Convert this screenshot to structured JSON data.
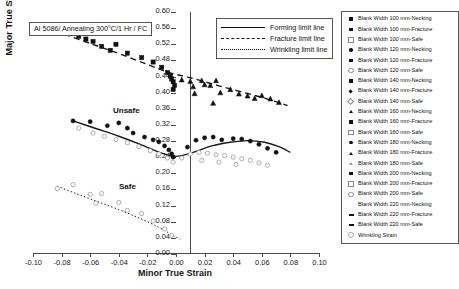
{
  "annotation": {
    "text": "Al 5086/ Annealing 300°C/1 Hr / FC"
  },
  "region_labels": {
    "unsafe": "Unsafe",
    "safe": "Safe"
  },
  "line_legend": {
    "items": [
      {
        "label": "Forming limit line",
        "style": "solid"
      },
      {
        "label": "Fracture limit line",
        "style": "dashed"
      },
      {
        "label": "Wrinkling limit line",
        "style": "dotted"
      }
    ]
  },
  "marker_legend": {
    "items": [
      {
        "label": "Blank Width 100 mm-Necking",
        "glyph": "sq-f"
      },
      {
        "label": "Blank Width 100 mm-Fracture",
        "glyph": "sq-f"
      },
      {
        "label": "Blank Width 100 mm-Safe",
        "glyph": "sq-o"
      },
      {
        "label": "Blank Width 120 mm-Necking",
        "glyph": "ci-f"
      },
      {
        "label": "Blank Width 120 mm-Fracture",
        "glyph": "sq-f"
      },
      {
        "label": "Blank Width 120 mm-Safe",
        "glyph": "ci-o"
      },
      {
        "label": "Blank Width 140 mm-Necking",
        "glyph": "sq-f"
      },
      {
        "label": "Blank Width 140 mm-Fracture",
        "glyph": "di-f"
      },
      {
        "label": "Blank Width 140 mm-Safe",
        "glyph": "di-o"
      },
      {
        "label": "Blank Width 160 mm-Necking",
        "glyph": "tr-f"
      },
      {
        "label": "Blank Width 160 mm-Fracture",
        "glyph": "sq-f"
      },
      {
        "label": "Blank Width 160 mm-Safe",
        "glyph": "sq-o"
      },
      {
        "label": "Blank Width 180 mm-Necking",
        "glyph": "ci-f"
      },
      {
        "label": "Blank Width 180 mm-Fracture",
        "glyph": "tr-f"
      },
      {
        "label": "Blank Width 180 mm-Safe",
        "glyph": "tr-o"
      },
      {
        "label": "Blank Width 200 mm-Necking",
        "glyph": "sq-f"
      },
      {
        "label": "Blank Width 200 mm-Fracture",
        "glyph": "sq-o"
      },
      {
        "label": "Blank Width 200 mm-Safe",
        "glyph": "ci-o"
      },
      {
        "label": "Blank Width 220 mm-Necking",
        "glyph": "blank"
      },
      {
        "label": "Blank Width 220 mm-Fracture",
        "glyph": "ba-f"
      },
      {
        "label": "Blank Width 220 mm-Safe",
        "glyph": "ba-f"
      },
      {
        "label": "Wrinkling Strain",
        "glyph": "st-o"
      }
    ]
  },
  "chart_data": {
    "type": "scatter",
    "title": "",
    "xlabel": "Minor True Strain",
    "ylabel": "Major True Strain",
    "xlim": [
      -0.1,
      0.1
    ],
    "ylim": [
      0.0,
      0.6
    ],
    "xticks": [
      "-0.10",
      "-0.08",
      "-0.06",
      "-0.04",
      "-0.02",
      "0.00",
      "0.02",
      "0.04",
      "0.06",
      "0.08",
      "0.10"
    ],
    "xtick_values": [
      -0.1,
      -0.08,
      -0.06,
      -0.04,
      -0.02,
      0.0,
      0.02,
      0.04,
      0.06,
      0.08,
      0.1
    ],
    "yticks": [
      "0.00",
      "0.04",
      "0.08",
      "0.12",
      "0.16",
      "0.20",
      "0.24",
      "0.28",
      "0.32",
      "0.36",
      "0.40",
      "0.44",
      "0.48",
      "0.52",
      "0.56",
      "0.60"
    ],
    "ytick_values": [
      0.0,
      0.04,
      0.08,
      0.12,
      0.16,
      0.2,
      0.24,
      0.28,
      0.32,
      0.36,
      0.4,
      0.44,
      0.48,
      0.52,
      0.56,
      0.6
    ],
    "grid": false,
    "legend_position": "right",
    "curves": [
      {
        "name": "Fracture limit line",
        "style": "dashed",
        "points": [
          [
            -0.078,
            0.545
          ],
          [
            -0.06,
            0.522
          ],
          [
            -0.04,
            0.497
          ],
          [
            -0.02,
            0.47
          ],
          [
            -0.005,
            0.45
          ],
          [
            0.01,
            0.437
          ],
          [
            0.03,
            0.417
          ],
          [
            0.05,
            0.398
          ],
          [
            0.066,
            0.382
          ],
          [
            0.078,
            0.368
          ]
        ]
      },
      {
        "name": "Forming limit line",
        "style": "solid",
        "points": [
          [
            -0.072,
            0.33
          ],
          [
            -0.055,
            0.31
          ],
          [
            -0.04,
            0.292
          ],
          [
            -0.025,
            0.272
          ],
          [
            -0.01,
            0.25
          ],
          [
            0.0,
            0.242
          ],
          [
            0.012,
            0.252
          ],
          [
            0.025,
            0.268
          ],
          [
            0.038,
            0.277
          ],
          [
            0.05,
            0.281
          ],
          [
            0.062,
            0.277
          ],
          [
            0.072,
            0.266
          ],
          [
            0.08,
            0.252
          ]
        ]
      },
      {
        "name": "Wrinkling limit line",
        "style": "dotted",
        "points": [
          [
            -0.083,
            0.168
          ],
          [
            -0.07,
            0.15
          ],
          [
            -0.055,
            0.13
          ],
          [
            -0.04,
            0.11
          ],
          [
            -0.025,
            0.088
          ],
          [
            -0.012,
            0.066
          ],
          [
            -0.003,
            0.048
          ],
          [
            0.003,
            0.036
          ]
        ]
      }
    ],
    "series": [
      {
        "name": "Fracture points (upper band)",
        "glyph": "sq-f",
        "points": [
          [
            -0.063,
            0.533
          ],
          [
            -0.058,
            0.527
          ],
          [
            -0.052,
            0.515
          ],
          [
            -0.042,
            0.52
          ],
          [
            -0.034,
            0.498
          ],
          [
            -0.024,
            0.487
          ],
          [
            -0.016,
            0.476
          ],
          [
            -0.01,
            0.463
          ],
          [
            -0.006,
            0.45
          ],
          [
            -0.004,
            0.441
          ],
          [
            -0.003,
            0.434
          ],
          [
            -0.002,
            0.427
          ],
          [
            -0.001,
            0.418
          ],
          [
            -0.002,
            0.408
          ],
          [
            -0.068,
            0.54
          ],
          [
            -0.046,
            0.505
          ]
        ]
      },
      {
        "name": "Fracture points (right band)",
        "glyph": "tr-f",
        "points": [
          [
            0.004,
            0.432
          ],
          [
            0.01,
            0.428
          ],
          [
            0.012,
            0.415
          ],
          [
            0.018,
            0.43
          ],
          [
            0.02,
            0.42
          ],
          [
            0.024,
            0.418
          ],
          [
            0.028,
            0.43
          ],
          [
            0.013,
            0.398
          ],
          [
            0.031,
            0.4
          ],
          [
            0.038,
            0.408
          ],
          [
            0.044,
            0.397
          ],
          [
            0.05,
            0.392
          ],
          [
            0.055,
            0.386
          ],
          [
            0.06,
            0.393
          ],
          [
            0.066,
            0.385
          ],
          [
            0.072,
            0.376
          ],
          [
            0.026,
            0.374
          ]
        ]
      },
      {
        "name": "Necking points (mid band)",
        "glyph": "ci-f",
        "points": [
          [
            -0.072,
            0.33
          ],
          [
            -0.06,
            0.328
          ],
          [
            -0.048,
            0.318
          ],
          [
            -0.04,
            0.325
          ],
          [
            -0.034,
            0.312
          ],
          [
            -0.03,
            0.3
          ],
          [
            -0.022,
            0.29
          ],
          [
            -0.016,
            0.283
          ],
          [
            -0.012,
            0.278
          ],
          [
            -0.008,
            0.268
          ],
          [
            -0.005,
            0.258
          ],
          [
            -0.003,
            0.248
          ],
          [
            -0.002,
            0.24
          ],
          [
            0.008,
            0.265
          ],
          [
            0.014,
            0.282
          ],
          [
            0.02,
            0.288
          ],
          [
            0.026,
            0.29
          ],
          [
            0.032,
            0.283
          ],
          [
            0.04,
            0.286
          ],
          [
            0.046,
            0.285
          ],
          [
            0.052,
            0.28
          ],
          [
            0.058,
            0.272
          ],
          [
            0.064,
            0.262
          ],
          [
            0.07,
            0.252
          ]
        ]
      },
      {
        "name": "Safe points (below forming limit)",
        "glyph": "ci-o",
        "points": [
          [
            -0.068,
            0.312
          ],
          [
            -0.058,
            0.3
          ],
          [
            -0.05,
            0.292
          ],
          [
            -0.042,
            0.284
          ],
          [
            -0.034,
            0.276
          ],
          [
            -0.026,
            0.266
          ],
          [
            -0.018,
            0.256
          ],
          [
            -0.012,
            0.248
          ],
          [
            -0.006,
            0.238
          ],
          [
            -0.002,
            0.228
          ],
          [
            0.004,
            0.238
          ],
          [
            0.01,
            0.248
          ],
          [
            0.016,
            0.252
          ],
          [
            0.022,
            0.25
          ],
          [
            0.028,
            0.246
          ],
          [
            0.034,
            0.244
          ],
          [
            0.04,
            0.24
          ],
          [
            0.046,
            0.236
          ],
          [
            0.052,
            0.232
          ],
          [
            0.058,
            0.226
          ],
          [
            0.064,
            0.22
          ],
          [
            0.018,
            0.232
          ],
          [
            0.03,
            0.228
          ],
          [
            0.042,
            0.222
          ]
        ]
      },
      {
        "name": "Wrinkling strain points",
        "glyph": "st-o",
        "points": [
          [
            -0.083,
            0.162
          ],
          [
            -0.072,
            0.172
          ],
          [
            -0.06,
            0.148
          ],
          [
            -0.052,
            0.15
          ],
          [
            -0.056,
            0.126
          ],
          [
            -0.04,
            0.128
          ],
          [
            -0.034,
            0.108
          ],
          [
            -0.024,
            0.1
          ],
          [
            -0.016,
            0.082
          ],
          [
            -0.008,
            0.062
          ],
          [
            -0.003,
            0.046
          ]
        ]
      }
    ]
  }
}
